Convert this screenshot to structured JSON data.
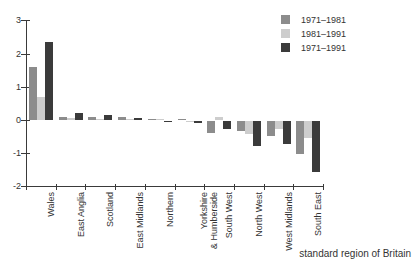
{
  "chart_data": {
    "type": "bar",
    "title": "",
    "categories": [
      "Wales",
      "East Anglia",
      "Scotland",
      "East Midlands",
      "Northern",
      "Yorkshire\n& Humberside",
      "South West",
      "North West",
      "West Midlands",
      "South East"
    ],
    "series": [
      {
        "name": "1971–1981",
        "color": "#8c8c8c",
        "values": [
          1.6,
          0.1,
          0.1,
          0.1,
          0.02,
          0.02,
          -0.35,
          -0.3,
          -0.45,
          -1.0
        ]
      },
      {
        "name": "1981–1991",
        "color": "#cdcdcd",
        "values": [
          0.7,
          0.05,
          0.03,
          0.02,
          0.01,
          -0.02,
          0.1,
          -0.4,
          -0.25,
          -0.5
        ]
      },
      {
        "name": "1971–1991",
        "color": "#3b3b3b",
        "values": [
          2.35,
          0.2,
          0.15,
          0.05,
          -0.02,
          -0.05,
          -0.25,
          -0.75,
          -0.7,
          -1.55
        ]
      }
    ],
    "xlabel": "standard region of Britain",
    "ylabel": "",
    "ylim": [
      -2,
      3
    ],
    "yticks": [
      3,
      2,
      1,
      0,
      -1,
      -2
    ],
    "legend_position": "top-right",
    "grid": false,
    "axis_color": "#3a3a3a"
  }
}
